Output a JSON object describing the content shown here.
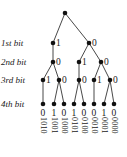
{
  "diagram": {
    "type": "binary-tree",
    "level_labels": [
      "1st bit",
      "2nd bit",
      "3rd bit",
      "4th bit"
    ],
    "nodes": [
      {
        "id": "root",
        "x": 65,
        "y": 13,
        "label": ""
      },
      {
        "id": "a1",
        "x": 53,
        "y": 43,
        "label": "1"
      },
      {
        "id": "a0",
        "x": 89,
        "y": 43,
        "label": "0"
      },
      {
        "id": "b10",
        "x": 53,
        "y": 62,
        "label": "0"
      },
      {
        "id": "b01",
        "x": 79,
        "y": 62,
        "label": "1"
      },
      {
        "id": "b00",
        "x": 101,
        "y": 62,
        "label": "0"
      },
      {
        "id": "c101",
        "x": 43,
        "y": 80,
        "label": "1"
      },
      {
        "id": "c100",
        "x": 59,
        "y": 80,
        "label": "0"
      },
      {
        "id": "c010",
        "x": 79,
        "y": 80,
        "label": "0"
      },
      {
        "id": "c001",
        "x": 94,
        "y": 80,
        "label": "1"
      },
      {
        "id": "c000",
        "x": 110,
        "y": 80,
        "label": "0"
      },
      {
        "id": "d1010",
        "x": 43,
        "y": 104,
        "label": "0"
      },
      {
        "id": "d1001",
        "x": 54,
        "y": 104,
        "label": "1"
      },
      {
        "id": "d1000",
        "x": 64,
        "y": 104,
        "label": "0"
      },
      {
        "id": "d0101",
        "x": 74,
        "y": 104,
        "label": "1"
      },
      {
        "id": "d0100",
        "x": 84,
        "y": 104,
        "label": "0"
      },
      {
        "id": "d0010",
        "x": 94,
        "y": 104,
        "label": "0"
      },
      {
        "id": "d0001",
        "x": 104,
        "y": 104,
        "label": "1"
      },
      {
        "id": "d0000",
        "x": 114,
        "y": 104,
        "label": "0"
      }
    ],
    "edges": [
      [
        "root",
        "a1"
      ],
      [
        "root",
        "a0"
      ],
      [
        "a1",
        "b10"
      ],
      [
        "a0",
        "b01"
      ],
      [
        "a0",
        "b00"
      ],
      [
        "b10",
        "c101"
      ],
      [
        "b10",
        "c100"
      ],
      [
        "b01",
        "c010"
      ],
      [
        "b00",
        "c001"
      ],
      [
        "b00",
        "c000"
      ],
      [
        "c101",
        "d1010"
      ],
      [
        "c100",
        "d1001"
      ],
      [
        "c100",
        "d1000"
      ],
      [
        "c010",
        "d0101"
      ],
      [
        "c010",
        "d0100"
      ],
      [
        "c001",
        "d0010"
      ],
      [
        "c000",
        "d0001"
      ],
      [
        "c000",
        "d0000"
      ]
    ],
    "leaf_bits": [
      "0",
      "1",
      "0",
      "1",
      "0",
      "0",
      "1",
      "0"
    ],
    "codewords": [
      "1010",
      "1001",
      "1000",
      "0101",
      "0100",
      "0010",
      "0001",
      "0000"
    ],
    "colors": {
      "line": "#333333",
      "node": "#111111",
      "text": "#1a1a1a"
    }
  }
}
